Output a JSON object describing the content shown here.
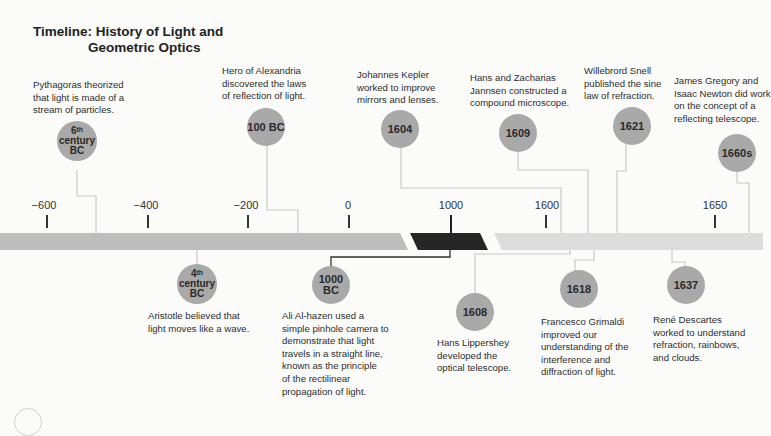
{
  "title": {
    "line1": "Timeline: History of Light and",
    "line2": "Geometric Optics"
  },
  "axis": {
    "ticks": [
      {
        "label": "−600"
      },
      {
        "label": "−400"
      },
      {
        "label": "−200"
      },
      {
        "label": "0"
      },
      {
        "label": "1000"
      },
      {
        "label": "1600"
      },
      {
        "label": "1650"
      }
    ],
    "colors": {
      "ancient_bar": "#bdbdbd",
      "medieval_bar": "#262626",
      "modern_bar": "#dcdcdc",
      "marker": "#a9a9a9",
      "connector": "#c8c8c8"
    }
  },
  "events_above": [
    {
      "date_parts": [
        "6",
        "th",
        "century",
        "BC"
      ],
      "text": [
        "Pythagoras theorized",
        "that light is made of a",
        "stream of particles."
      ]
    },
    {
      "date": "100 BC",
      "text": [
        "Hero of Alexandria",
        "discovered the laws",
        "of reflection of light."
      ]
    },
    {
      "date": "1604",
      "text": [
        "Johannes Kepler",
        "worked to improve",
        "mirrors and lenses."
      ]
    },
    {
      "date": "1609",
      "text": [
        "Hans and Zacharias",
        "Jannsen constructed a",
        "compound microscope."
      ]
    },
    {
      "date": "1621",
      "text": [
        "Willebrord Snell",
        "published the sine",
        "law of refraction."
      ]
    },
    {
      "date": "1660s",
      "text": [
        "James Gregory and",
        "Isaac Newton did work",
        "on the concept of a",
        "reflecting telescope."
      ]
    }
  ],
  "events_below": [
    {
      "date_parts": [
        "4",
        "th",
        "century",
        "BC"
      ],
      "text": [
        "Aristotle believed that",
        "light moves like a wave."
      ]
    },
    {
      "date_parts": [
        "1000",
        "BC"
      ],
      "text": [
        "Ali Al-hazen used a",
        "simple pinhole camera to",
        "demonstrate that light",
        "travels in a straight line,",
        "known as the principle",
        "of the rectilinear",
        "propagation of light."
      ]
    },
    {
      "date": "1608",
      "text": [
        "Hans Lippershey",
        "developed the",
        "optical telescope."
      ]
    },
    {
      "date": "1618",
      "text": [
        "Francesco Grimaldi",
        "improved our",
        "understanding of the",
        "interference and",
        "diffraction of light."
      ]
    },
    {
      "date": "1637",
      "text": [
        "René Descartes",
        "worked to understand",
        "refraction, rainbows,",
        "and clouds."
      ]
    }
  ]
}
